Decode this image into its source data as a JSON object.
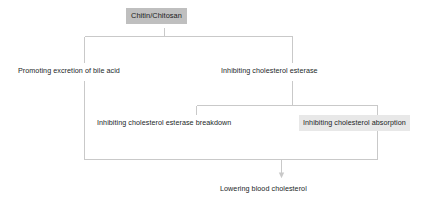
{
  "diagram": {
    "type": "flowchart",
    "title": "Chitin/Chitosan",
    "colors": {
      "background": "#ffffff",
      "line": "#c9c9c9",
      "title_fill": "#bfbfbf",
      "highlight_fill": "#e8e8e8",
      "text": "#221f1f"
    },
    "nodes": [
      {
        "id": "chitin-chitosan",
        "label": "Chitin/Chitosan",
        "style": "filled-gray",
        "level": 0
      },
      {
        "id": "promoting-excretion-of-bile-acid",
        "label": "Promoting excretion of bile acid",
        "style": "plain",
        "level": 1
      },
      {
        "id": "inhibiting-cholesterol-esterase",
        "label": "Inhibiting cholesterol esterase",
        "style": "plain",
        "level": 1
      },
      {
        "id": "inhibiting-cholesterol-esterase-breakdown",
        "label": "Inhibiting cholesterol esterase breakdown",
        "style": "plain",
        "level": 2
      },
      {
        "id": "inhibiting-cholesterol-absorption",
        "label": "Inhibiting cholesterol absorption",
        "style": "highlighted",
        "level": 2
      },
      {
        "id": "lowering-blood-cholesterol",
        "label": "Lowering blood cholesterol",
        "style": "plain",
        "level": 3
      }
    ],
    "edges": [
      {
        "from": "chitin-chitosan",
        "to": "promoting-excretion-of-bile-acid"
      },
      {
        "from": "chitin-chitosan",
        "to": "inhibiting-cholesterol-esterase"
      },
      {
        "from": "inhibiting-cholesterol-esterase",
        "to": "inhibiting-cholesterol-esterase-breakdown"
      },
      {
        "from": "inhibiting-cholesterol-esterase",
        "to": "inhibiting-cholesterol-absorption"
      },
      {
        "from": "promoting-excretion-of-bile-acid",
        "to": "lowering-blood-cholesterol",
        "arrow": true
      },
      {
        "from": "inhibiting-cholesterol-absorption",
        "to": "lowering-blood-cholesterol",
        "arrow": true
      }
    ]
  }
}
